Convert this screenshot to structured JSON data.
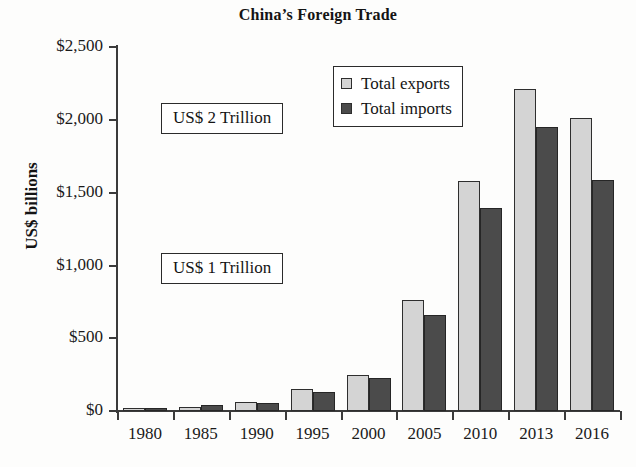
{
  "chart_data": {
    "type": "bar",
    "title": "China’s Foreign Trade",
    "xlabel": "",
    "ylabel": "US$ billions",
    "ylim": [
      0,
      2500
    ],
    "ytick_labels": [
      "$0",
      "$500",
      "$1,000",
      "$1,500",
      "$2,000",
      "$2,500"
    ],
    "ytick_values": [
      0,
      500,
      1000,
      1500,
      2000,
      2500
    ],
    "grid": false,
    "legend_position": "upper-center",
    "categories": [
      "1980",
      "1985",
      "1990",
      "1995",
      "2000",
      "2005",
      "2010",
      "2013",
      "2016"
    ],
    "series": [
      {
        "name": "Total exports",
        "color": "#d4d4d4",
        "values": [
          18,
          27,
          62,
          149,
          249,
          762,
          1578,
          2209,
          2012
        ]
      },
      {
        "name": "Total imports",
        "color": "#4b4b4b",
        "values": [
          20,
          42,
          53,
          132,
          225,
          660,
          1396,
          1950,
          1588
        ]
      }
    ],
    "annotations": [
      {
        "text": "US$ 2 Trillion",
        "value": 2000
      },
      {
        "text": "US$ 1 Trillion",
        "value": 1000
      }
    ]
  }
}
